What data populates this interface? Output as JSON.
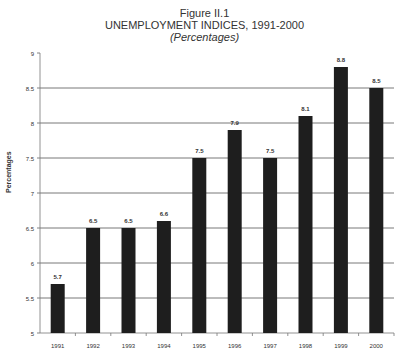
{
  "figure": {
    "number": "Figure II.1",
    "title": "UNEMPLOYMENT INDICES, 1991-2000",
    "subtitle": "(Percentages)"
  },
  "chart_data": {
    "type": "bar",
    "title": "UNEMPLOYMENT INDICES, 1991-2000",
    "subtitle": "(Percentages)",
    "xlabel": "",
    "ylabel": "Percentages",
    "categories": [
      "1991",
      "1992",
      "1993",
      "1994",
      "1995",
      "1996",
      "1997",
      "1998",
      "1999",
      "2000"
    ],
    "values": [
      5.7,
      6.5,
      6.5,
      6.6,
      7.5,
      7.9,
      7.5,
      8.1,
      8.8,
      8.5
    ],
    "data_labels": [
      "5.7",
      "6.5",
      "6.5",
      "6.6",
      "7.5",
      "7.9",
      "7.5",
      "8.1",
      "8.8",
      "8.5"
    ],
    "ylim": [
      5,
      9
    ],
    "yticks": [
      "5",
      "5.5",
      "6",
      "6.5",
      "7",
      "7.5",
      "8",
      "8.5",
      "9"
    ],
    "grid": true,
    "legend": null,
    "bar_color": "#1e1e1e",
    "grid_color": "#555555"
  }
}
